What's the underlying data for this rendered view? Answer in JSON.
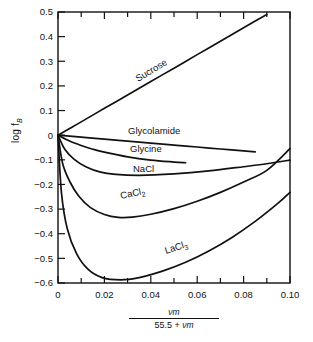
{
  "figure": {
    "background": "#ffffff",
    "ink_color": "#111111"
  },
  "axes": {
    "y_label_main": "log f",
    "y_label_sub": "B",
    "x_label_numerator": "νm",
    "x_label_denominator_text": "55.5 + ",
    "x_label_denominator_italic": "νm"
  },
  "chart_data": {
    "type": "line",
    "title": "",
    "xlabel": "νm / (55.5 + νm)",
    "ylabel": "log f_B",
    "xlim": [
      0,
      0.1
    ],
    "ylim": [
      -0.6,
      0.5
    ],
    "grid": false,
    "legend": "inline-curve-labels",
    "x_ticks": [
      0,
      0.02,
      0.04,
      0.06,
      0.08,
      0.1
    ],
    "x_tick_labels": [
      "0",
      "0.02",
      "0.04",
      "0.06",
      "0.08",
      "0.10"
    ],
    "x_minor_ticks": [
      0.01,
      0.03,
      0.05,
      0.07,
      0.09
    ],
    "y_ticks": [
      0.5,
      0.4,
      0.3,
      0.2,
      0.1,
      0,
      -0.1,
      -0.2,
      -0.3,
      -0.4,
      -0.5,
      -0.6
    ],
    "y_tick_labels": [
      "0.5",
      "0.4",
      "0.3",
      "0.2",
      "0.1",
      "0",
      "−0.1",
      "−0.2",
      "−0.3",
      "−0.4",
      "−0.5",
      "−0.6"
    ],
    "series": [
      {
        "name": "Sucrose",
        "label": "Sucrose",
        "label_sub": "",
        "x": [
          0,
          0.005,
          0.01,
          0.02,
          0.03,
          0.04,
          0.05,
          0.06,
          0.07,
          0.08,
          0.09
        ],
        "y": [
          0,
          0.027,
          0.054,
          0.109,
          0.163,
          0.218,
          0.272,
          0.327,
          0.381,
          0.436,
          0.49
        ]
      },
      {
        "name": "Glycolamide",
        "label": "Glycolamide",
        "label_sub": "",
        "x": [
          0,
          0.01,
          0.02,
          0.03,
          0.04,
          0.05,
          0.06,
          0.07,
          0.08,
          0.085
        ],
        "y": [
          0,
          -0.008,
          -0.016,
          -0.024,
          -0.032,
          -0.04,
          -0.048,
          -0.056,
          -0.064,
          -0.068
        ]
      },
      {
        "name": "Glycine",
        "label": "Glycine",
        "label_sub": "",
        "x": [
          0,
          0.005,
          0.01,
          0.015,
          0.02,
          0.03,
          0.04,
          0.05,
          0.055
        ],
        "y": [
          0,
          -0.024,
          -0.042,
          -0.057,
          -0.069,
          -0.088,
          -0.101,
          -0.109,
          -0.112
        ]
      },
      {
        "name": "NaCl",
        "label": "NaCl",
        "label_sub": "",
        "x": [
          0,
          0.003,
          0.007,
          0.012,
          0.018,
          0.025,
          0.035,
          0.05,
          0.065,
          0.08,
          0.09,
          0.1
        ],
        "y": [
          0,
          -0.058,
          -0.098,
          -0.128,
          -0.149,
          -0.159,
          -0.163,
          -0.157,
          -0.145,
          -0.128,
          -0.116,
          -0.101
        ]
      },
      {
        "name": "CaCl2",
        "label": "CaCl",
        "label_sub": "2",
        "x": [
          0,
          0.002,
          0.005,
          0.009,
          0.014,
          0.02,
          0.026,
          0.032,
          0.04,
          0.05,
          0.06,
          0.07,
          0.08,
          0.09,
          0.1
        ],
        "y": [
          0,
          -0.115,
          -0.187,
          -0.248,
          -0.294,
          -0.322,
          -0.334,
          -0.333,
          -0.321,
          -0.298,
          -0.268,
          -0.232,
          -0.19,
          -0.143,
          -0.055
        ]
      },
      {
        "name": "LaCl3",
        "label": "LaCl",
        "label_sub": "3",
        "x": [
          0,
          0.0015,
          0.004,
          0.008,
          0.013,
          0.019,
          0.027,
          0.035,
          0.045,
          0.055,
          0.065,
          0.075,
          0.085,
          0.095,
          0.1
        ],
        "y": [
          0,
          -0.235,
          -0.38,
          -0.481,
          -0.545,
          -0.578,
          -0.587,
          -0.578,
          -0.552,
          -0.516,
          -0.47,
          -0.415,
          -0.35,
          -0.275,
          -0.232
        ]
      }
    ]
  },
  "curve_labels": [
    {
      "name": "Sucrose",
      "text": "Sucrose",
      "sub": "",
      "x": 138,
      "y": 82,
      "rotate": -31
    },
    {
      "name": "Glycolamide",
      "text": "Glycolamide",
      "sub": "",
      "x": 128,
      "y": 134,
      "rotate": 0
    },
    {
      "name": "Glycine",
      "text": "Glycine",
      "sub": "",
      "x": 130,
      "y": 152,
      "rotate": 0
    },
    {
      "name": "NaCl",
      "text": "NaCl",
      "sub": "",
      "x": 133,
      "y": 172,
      "rotate": 0
    },
    {
      "name": "CaCl2",
      "text": "CaCl",
      "sub": "2",
      "x": 121,
      "y": 199,
      "rotate": -12
    },
    {
      "name": "LaCl3",
      "text": "LaCl",
      "sub": "3",
      "x": 166,
      "y": 254,
      "rotate": -18
    }
  ]
}
